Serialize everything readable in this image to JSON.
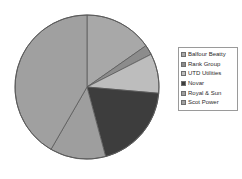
{
  "chart_data": {
    "type": "pie",
    "title": "",
    "subtitle": "",
    "xlabel": "",
    "ylabel": "",
    "grid": false,
    "legend_position": "right",
    "start_angle_deg": 0,
    "direction": "clockwise",
    "categories": [
      "Balfour Beatty",
      "Rank Group",
      "UTD Utilities",
      "Royal & Sun",
      "Novar",
      "Scot Power"
    ],
    "slices": [
      {
        "label": "Balfour Beatty",
        "value": 15.3,
        "angle_deg": 55,
        "color": "#a8a8a8"
      },
      {
        "label": "Rank Group",
        "value": 2.2,
        "angle_deg": 8,
        "color": "#8c8c8c"
      },
      {
        "label": "UTD Utilities",
        "value": 8.9,
        "angle_deg": 32,
        "color": "#bdbdbd"
      },
      {
        "label": "Novar",
        "value": 19.4,
        "angle_deg": 70,
        "color": "#3d3d3d"
      },
      {
        "label": "Royal & Sun",
        "value": 12.5,
        "angle_deg": 45,
        "color": "#9e9e9e"
      },
      {
        "label": "Scot Power",
        "value": 41.7,
        "angle_deg": 150,
        "color": "#a0a0a0"
      }
    ],
    "values": [
      15.3,
      2.2,
      8.9,
      19.4,
      12.5,
      41.7
    ]
  },
  "legend": {
    "items": [
      {
        "label": "Balfour Beatty",
        "color": "#a8a8a8"
      },
      {
        "label": "Rank Group",
        "color": "#8c8c8c"
      },
      {
        "label": "UTD Utilities",
        "color": "#bdbdbd"
      },
      {
        "label": "Novar",
        "color": "#3d3d3d"
      },
      {
        "label": "Royal & Sun",
        "color": "#9e9e9e"
      },
      {
        "label": "Scot Power",
        "color": "#a0a0a0"
      }
    ]
  },
  "style": {
    "background": "#ffffff",
    "pie_outline": "#5a5a5a",
    "legend_border": "#9a9a9a",
    "text_color": "#2b2b2b"
  },
  "geometry": {
    "center_x": 87,
    "center_y": 87,
    "radius": 72
  }
}
